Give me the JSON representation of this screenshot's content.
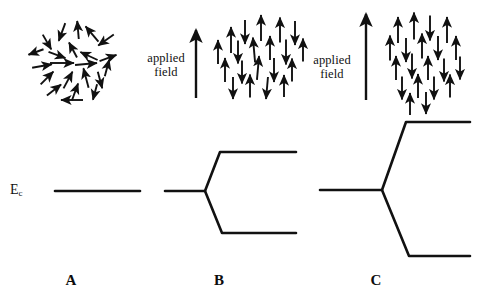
{
  "figure": {
    "background_color": "#ffffff",
    "ink_color": "#111111",
    "width": 481,
    "height": 301
  },
  "labels": {
    "energy_level": {
      "symbol": "E",
      "subscript": "c",
      "full": "Ec"
    },
    "applied_field": "applied\nfield",
    "panel_a": "A",
    "panel_b": "B",
    "panel_c": "C"
  },
  "panels": [
    {
      "id": "A",
      "letter": "A",
      "field_strength": "none",
      "field_label_shown": false,
      "spin_state": "randomly oriented spins",
      "level_state": "single unsplit level",
      "level_label_shown": true
    },
    {
      "id": "B",
      "letter": "B",
      "field_strength": "moderate",
      "field_label_shown": true,
      "spin_state": "partially aligned spins, mixed up and down",
      "level_state": "level split into two branches",
      "level_label_shown": false
    },
    {
      "id": "C",
      "letter": "C",
      "field_strength": "strong",
      "field_label_shown": true,
      "spin_state": "more strongly aligned spins, mixed up and down",
      "level_state": "level split into two widely separated branches",
      "level_label_shown": false
    }
  ],
  "chart_data": {
    "type": "line",
    "xlabel": "",
    "ylabel": "",
    "series": [
      {
        "name": "A - no field, unsplit level",
        "points": [
          [
            55,
            191
          ],
          [
            140,
            191
          ]
        ]
      },
      {
        "name": "B - upper branch",
        "points": [
          [
            165,
            191
          ],
          [
            205,
            191
          ],
          [
            220,
            152
          ],
          [
            296,
            152
          ]
        ]
      },
      {
        "name": "B - lower branch",
        "points": [
          [
            205,
            191
          ],
          [
            222,
            233
          ],
          [
            296,
            233
          ]
        ]
      },
      {
        "name": "C - upper branch",
        "points": [
          [
            320,
            190
          ],
          [
            382,
            190
          ],
          [
            406,
            122
          ],
          [
            470,
            122
          ]
        ]
      },
      {
        "name": "C - lower branch",
        "points": [
          [
            382,
            190
          ],
          [
            409,
            256
          ],
          [
            470,
            256
          ]
        ]
      }
    ],
    "splitting_magnitudes": {
      "A": 0,
      "B": 81,
      "C": 134
    }
  },
  "field_arrows": [
    {
      "panel": "B",
      "x": 196,
      "y_tail": 98,
      "y_head": 30,
      "length": 68
    },
    {
      "panel": "C",
      "x": 366,
      "y_tail": 100,
      "y_head": 14,
      "length": 86
    }
  ],
  "spin_clusters": {
    "A": {
      "description": "disordered spins, random orientations",
      "arrows": [
        {
          "x": 62,
          "y": 32,
          "angle": 250,
          "len": 19
        },
        {
          "x": 47,
          "y": 42,
          "angle": 300,
          "len": 17
        },
        {
          "x": 78,
          "y": 30,
          "angle": 95,
          "len": 18
        },
        {
          "x": 92,
          "y": 34,
          "angle": 130,
          "len": 20
        },
        {
          "x": 106,
          "y": 40,
          "angle": 215,
          "len": 19
        },
        {
          "x": 36,
          "y": 52,
          "angle": 200,
          "len": 16
        },
        {
          "x": 57,
          "y": 55,
          "angle": 340,
          "len": 18
        },
        {
          "x": 73,
          "y": 50,
          "angle": 118,
          "len": 17
        },
        {
          "x": 89,
          "y": 56,
          "angle": 155,
          "len": 19
        },
        {
          "x": 108,
          "y": 58,
          "angle": 20,
          "len": 18
        },
        {
          "x": 42,
          "y": 66,
          "angle": 10,
          "len": 20
        },
        {
          "x": 62,
          "y": 63,
          "angle": 0,
          "len": 24
        },
        {
          "x": 86,
          "y": 64,
          "angle": 5,
          "len": 22
        },
        {
          "x": 107,
          "y": 68,
          "angle": 75,
          "len": 17
        },
        {
          "x": 47,
          "y": 78,
          "angle": 45,
          "len": 18
        },
        {
          "x": 68,
          "y": 80,
          "angle": 62,
          "len": 19
        },
        {
          "x": 86,
          "y": 78,
          "angle": 105,
          "len": 20
        },
        {
          "x": 100,
          "y": 80,
          "angle": 285,
          "len": 17
        },
        {
          "x": 54,
          "y": 90,
          "angle": 38,
          "len": 18
        },
        {
          "x": 75,
          "y": 92,
          "angle": 70,
          "len": 18
        },
        {
          "x": 95,
          "y": 92,
          "angle": 255,
          "len": 16
        },
        {
          "x": 72,
          "y": 100,
          "angle": 180,
          "len": 22
        }
      ]
    },
    "B": {
      "description": "spins aligning with moderate applied field",
      "arrows": [
        {
          "x": 231,
          "y": 40,
          "angle": 90,
          "len": 26
        },
        {
          "x": 245,
          "y": 32,
          "angle": 270,
          "len": 24
        },
        {
          "x": 261,
          "y": 28,
          "angle": 90,
          "len": 26
        },
        {
          "x": 280,
          "y": 30,
          "angle": 90,
          "len": 25
        },
        {
          "x": 295,
          "y": 33,
          "angle": 270,
          "len": 24
        },
        {
          "x": 218,
          "y": 52,
          "angle": 90,
          "len": 24
        },
        {
          "x": 238,
          "y": 52,
          "angle": 270,
          "len": 23
        },
        {
          "x": 254,
          "y": 50,
          "angle": 95,
          "len": 25
        },
        {
          "x": 270,
          "y": 48,
          "angle": 90,
          "len": 24
        },
        {
          "x": 286,
          "y": 52,
          "angle": 270,
          "len": 25
        },
        {
          "x": 303,
          "y": 50,
          "angle": 90,
          "len": 23
        },
        {
          "x": 225,
          "y": 70,
          "angle": 90,
          "len": 24
        },
        {
          "x": 242,
          "y": 72,
          "angle": 270,
          "len": 23
        },
        {
          "x": 258,
          "y": 68,
          "angle": 85,
          "len": 24
        },
        {
          "x": 274,
          "y": 70,
          "angle": 270,
          "len": 24
        },
        {
          "x": 292,
          "y": 70,
          "angle": 90,
          "len": 23
        },
        {
          "x": 233,
          "y": 88,
          "angle": 270,
          "len": 22
        },
        {
          "x": 250,
          "y": 86,
          "angle": 90,
          "len": 23
        },
        {
          "x": 267,
          "y": 88,
          "angle": 265,
          "len": 22
        },
        {
          "x": 284,
          "y": 86,
          "angle": 90,
          "len": 22
        }
      ]
    },
    "C": {
      "description": "spins strongly aligning with strong applied field",
      "arrows": [
        {
          "x": 398,
          "y": 30,
          "angle": 90,
          "len": 26
        },
        {
          "x": 414,
          "y": 26,
          "angle": 90,
          "len": 27
        },
        {
          "x": 430,
          "y": 28,
          "angle": 270,
          "len": 25
        },
        {
          "x": 447,
          "y": 30,
          "angle": 90,
          "len": 26
        },
        {
          "x": 390,
          "y": 48,
          "angle": 90,
          "len": 25
        },
        {
          "x": 406,
          "y": 50,
          "angle": 270,
          "len": 24
        },
        {
          "x": 422,
          "y": 46,
          "angle": 90,
          "len": 25
        },
        {
          "x": 438,
          "y": 48,
          "angle": 270,
          "len": 24
        },
        {
          "x": 456,
          "y": 48,
          "angle": 90,
          "len": 24
        },
        {
          "x": 396,
          "y": 68,
          "angle": 90,
          "len": 24
        },
        {
          "x": 412,
          "y": 66,
          "angle": 270,
          "len": 25
        },
        {
          "x": 428,
          "y": 68,
          "angle": 90,
          "len": 24
        },
        {
          "x": 444,
          "y": 70,
          "angle": 270,
          "len": 23
        },
        {
          "x": 460,
          "y": 68,
          "angle": 270,
          "len": 23
        },
        {
          "x": 402,
          "y": 88,
          "angle": 270,
          "len": 23
        },
        {
          "x": 418,
          "y": 86,
          "angle": 90,
          "len": 24
        },
        {
          "x": 434,
          "y": 88,
          "angle": 270,
          "len": 23
        },
        {
          "x": 450,
          "y": 86,
          "angle": 90,
          "len": 23
        },
        {
          "x": 410,
          "y": 104,
          "angle": 90,
          "len": 22
        },
        {
          "x": 426,
          "y": 103,
          "angle": 270,
          "len": 22
        }
      ]
    }
  }
}
